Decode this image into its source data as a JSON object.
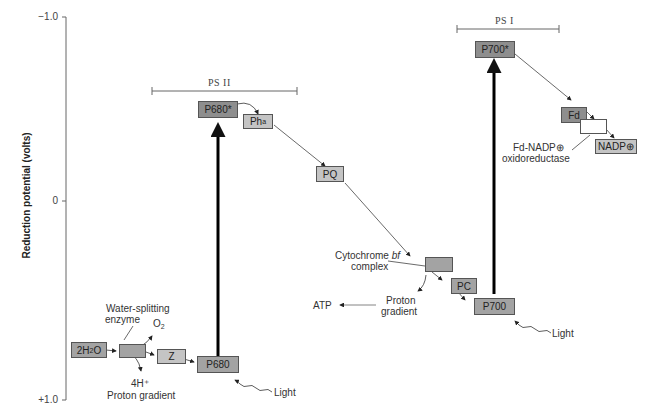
{
  "axis": {
    "label": "Reduction potential (volts)",
    "ticks": [
      "−1.0",
      "0",
      "+1.0"
    ]
  },
  "groups": {
    "ps2": "PS II",
    "ps1": "PS I"
  },
  "boxes": {
    "h2o": "2H₂O",
    "z": "Z",
    "p680": "P680",
    "p680_star": "P680*",
    "pha": "Ph",
    "pha_sub": "a",
    "pq": "PQ",
    "cyt_bf": "",
    "pc": "PC",
    "p700": "P700",
    "p700_star": "P700*",
    "fd": "Fd",
    "fnr": "",
    "nadp": "NADP⊕"
  },
  "labels": {
    "water_splitting_1": "Water-splitting",
    "water_splitting_2": "enzyme",
    "o2": "O₂",
    "h_plus": "4H⁺",
    "proton_gradient_1": "Proton gradient",
    "light_1": "Light",
    "cyt_1": "Cytochrome",
    "cyt_italic": "bf",
    "cyt_2": "complex",
    "proton_2a": "Proton",
    "proton_2b": "gradient",
    "atp": "ATP",
    "light_2": "Light",
    "fnr_1": "Fd-NADP⊕",
    "fnr_2": "oxidoreductase"
  },
  "colors": {
    "dark_box": "#8e8e8e",
    "mid_box": "#a3a3a3",
    "light_box": "#c4c4c4",
    "line": "#444444"
  }
}
